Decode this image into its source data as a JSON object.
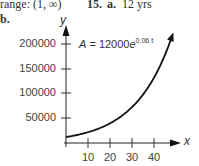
{
  "header": {
    "range_label": "range: (1, ∞)",
    "problem_number": "15.",
    "part_a_label": "a.",
    "part_a_answer": "12 yrs",
    "part_b_label": "b."
  },
  "chart_data": {
    "type": "line",
    "title": "",
    "xlabel": "x",
    "ylabel": "y",
    "equation": {
      "prefix": "A = 12000",
      "base": "e",
      "exponent": "0.06 t"
    },
    "x_ticks": [
      "10",
      "20",
      "30",
      "40"
    ],
    "y_ticks": [
      "200000",
      "150000",
      "100000",
      "50000"
    ],
    "xlim": [
      0,
      50
    ],
    "ylim": [
      0,
      240000
    ],
    "grid": false,
    "legend": "none",
    "series": [
      {
        "name": "A = 12000e^(0.06t)",
        "x": [
          0,
          5,
          10,
          15,
          20,
          25,
          30,
          35,
          40,
          45,
          49
        ],
        "values": [
          12000,
          16198,
          21865,
          29515,
          39841,
          53781,
          72595,
          97991,
          132278,
          178552,
          227084
        ]
      }
    ]
  }
}
